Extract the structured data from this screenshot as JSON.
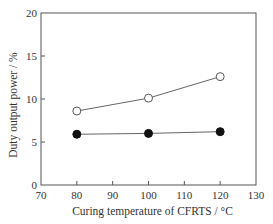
{
  "chart_data": {
    "type": "line",
    "title": "",
    "xlabel": "Curing temperature of CFRTS / °C",
    "ylabel": "Duty output power / %",
    "xlim": [
      70,
      130
    ],
    "ylim": [
      0,
      20
    ],
    "x_ticks": [
      70,
      80,
      90,
      100,
      110,
      120,
      130
    ],
    "y_ticks": [
      0,
      5,
      10,
      15,
      20
    ],
    "grid": false,
    "legend": null,
    "x": [
      80,
      100,
      120
    ],
    "series": [
      {
        "name": "open-circle",
        "marker": "open-circle",
        "values": [
          8.6,
          10.1,
          12.6
        ]
      },
      {
        "name": "filled-circle",
        "marker": "filled-circle",
        "values": [
          5.9,
          6.0,
          6.2
        ]
      }
    ]
  },
  "colors": {
    "axis": "#555555",
    "line": "#666666",
    "marker_fill_filled": "#111111",
    "marker_fill_open": "#ffffff",
    "text": "#333333"
  }
}
